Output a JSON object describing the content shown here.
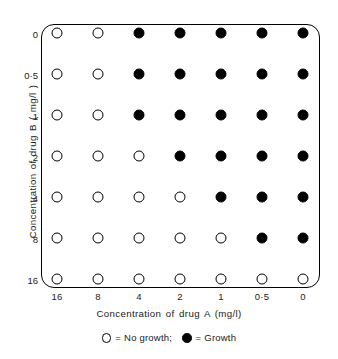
{
  "chart_data": {
    "type": "heatmap",
    "title": "",
    "xlabel": "Concentration of drug A  (mg/l)",
    "ylabel": "Concentration of drug B ( mg/l )",
    "x_categories": [
      "16",
      "8",
      "4",
      "2",
      "1",
      "0·5",
      "0"
    ],
    "y_categories": [
      "0",
      "0·5",
      "1",
      "2",
      "4",
      "8",
      "16"
    ],
    "marker_meaning": {
      "open": "No growth",
      "filled": "Growth"
    },
    "grid": false,
    "legend_position": "bottom-center",
    "rows": [
      {
        "y": "0",
        "cells": [
          "open",
          "open",
          "filled",
          "filled",
          "filled",
          "filled",
          "filled"
        ]
      },
      {
        "y": "0·5",
        "cells": [
          "open",
          "open",
          "filled",
          "filled",
          "filled",
          "filled",
          "filled"
        ]
      },
      {
        "y": "1",
        "cells": [
          "open",
          "open",
          "filled",
          "filled",
          "filled",
          "filled",
          "filled"
        ]
      },
      {
        "y": "2",
        "cells": [
          "open",
          "open",
          "open",
          "filled",
          "filled",
          "filled",
          "filled"
        ]
      },
      {
        "y": "4",
        "cells": [
          "open",
          "open",
          "open",
          "open",
          "filled",
          "filled",
          "filled"
        ]
      },
      {
        "y": "8",
        "cells": [
          "open",
          "open",
          "open",
          "open",
          "open",
          "filled",
          "filled"
        ]
      },
      {
        "y": "16",
        "cells": [
          "open",
          "open",
          "open",
          "open",
          "open",
          "open",
          "open"
        ]
      }
    ],
    "values": [
      [
        0,
        0,
        1,
        1,
        1,
        1,
        1
      ],
      [
        0,
        0,
        1,
        1,
        1,
        1,
        1
      ],
      [
        0,
        0,
        1,
        1,
        1,
        1,
        1
      ],
      [
        0,
        0,
        0,
        1,
        1,
        1,
        1
      ],
      [
        0,
        0,
        0,
        0,
        1,
        1,
        1
      ],
      [
        0,
        0,
        0,
        0,
        0,
        1,
        1
      ],
      [
        0,
        0,
        0,
        0,
        0,
        0,
        0
      ]
    ],
    "colors": {
      "growth": "#000000",
      "no_growth": "#ffffff",
      "stroke": "#000000",
      "background": "#ffffff"
    }
  },
  "axes": {
    "x_title": "Concentration of drug A  (mg/l)",
    "y_title": "Concentration of drug B ( mg/l )",
    "x_ticks": [
      "16",
      "8",
      "4",
      "2",
      "1",
      "0·5",
      "0"
    ],
    "y_ticks": [
      "0",
      "0·5",
      "1",
      "2",
      "4",
      "8",
      "16"
    ]
  },
  "legend": {
    "equals": "=",
    "separator": ";",
    "no_growth_label": "No growth",
    "growth_label": "Growth",
    "no_growth_symbol": "open-circle-icon",
    "growth_symbol": "filled-circle-icon"
  }
}
